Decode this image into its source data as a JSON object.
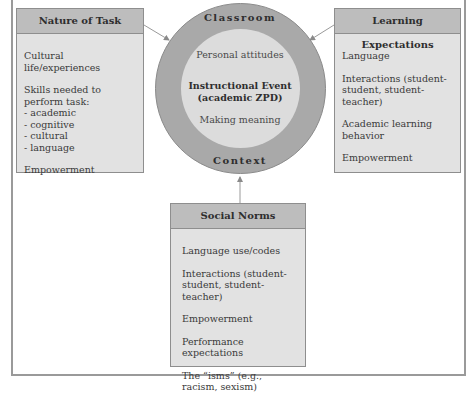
{
  "diagram": {
    "center": {
      "ring_top_label": "Classroom",
      "ring_bottom_label": "Context",
      "line1": "Personal attitudes",
      "line2a": "Instructional Event",
      "line2b": "(academic ZPD)",
      "line3": "Making meaning"
    },
    "nature_of_task": {
      "title": "Nature of Task",
      "items": [
        "Cultural life/experiences",
        "Skills needed to perform task:",
        "- academic",
        "- cognitive",
        "- cultural",
        "- language",
        "Empowerment"
      ]
    },
    "learning_expectations": {
      "title": "Learning Expectations",
      "items": [
        "Language",
        "Interactions (student-student, student-teacher)",
        "Academic learning behavior",
        "Empowerment"
      ]
    },
    "social_norms": {
      "title": "Social Norms",
      "items": [
        "Language use/codes",
        "Interactions (student-student, student-teacher)",
        "Empowerment",
        "Performance expectations",
        "The “isms” (e.g., racism, sexism)"
      ]
    },
    "colors": {
      "box_header": "#bdbdbd",
      "box_body": "#e2e2e2",
      "outer_ring": "#a9a9a9",
      "inner_circle": "#dcdcdc",
      "border": "#8e8e8e"
    }
  }
}
